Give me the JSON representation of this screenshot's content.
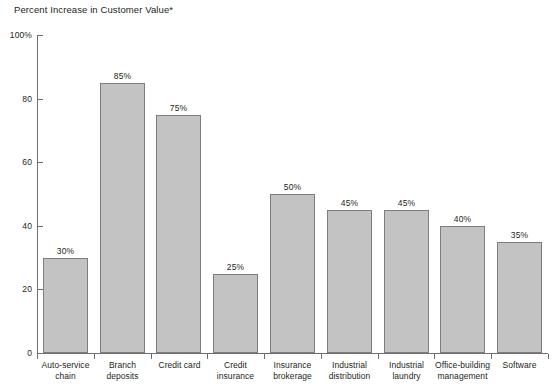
{
  "chart_data": {
    "type": "bar",
    "title": "Percent Increase in Customer Value*",
    "xlabel": "",
    "ylabel": "",
    "ylim": [
      0,
      100
    ],
    "ytick_labels": [
      "100%",
      "80",
      "60",
      "40",
      "20",
      "0"
    ],
    "ytick_values": [
      100,
      80,
      60,
      40,
      20,
      0
    ],
    "grid": false,
    "legend": "none",
    "bar_color": "#c3c3c3",
    "bar_border_color": "#7d7d7d",
    "axis_color": "#6e6e6e",
    "categories": [
      "Auto-service chain",
      "Branch deposits",
      "Credit card",
      "Credit insurance",
      "Insurance brokerage",
      "Industrial distribution",
      "Industrial laundry",
      "Office-building management",
      "Software"
    ],
    "category_lines": [
      [
        "Auto-service",
        "chain"
      ],
      [
        "Branch deposits"
      ],
      [
        "Credit card"
      ],
      [
        "Credit insurance"
      ],
      [
        "Insurance",
        "brokerage"
      ],
      [
        "Industrial",
        "distribution"
      ],
      [
        "Industrial",
        "laundry"
      ],
      [
        "Office-building",
        "management"
      ],
      [
        "Software"
      ]
    ],
    "values": [
      30,
      85,
      75,
      25,
      50,
      45,
      45,
      40,
      35
    ],
    "value_labels": [
      "30%",
      "85%",
      "75%",
      "25%",
      "50%",
      "45%",
      "45%",
      "40%",
      "35%"
    ]
  }
}
